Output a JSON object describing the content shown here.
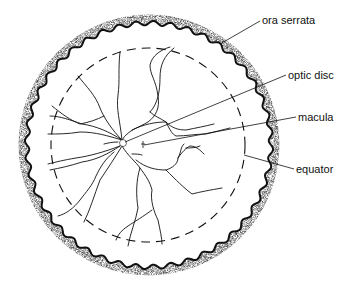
{
  "diagram": {
    "labels": {
      "ora_serrata": "ora serrata",
      "optic_disc": "optic disc",
      "macula": "macula",
      "equator": "equator"
    },
    "colors": {
      "ink": "#111111",
      "background": "#ffffff",
      "stipple": "#555555"
    }
  }
}
